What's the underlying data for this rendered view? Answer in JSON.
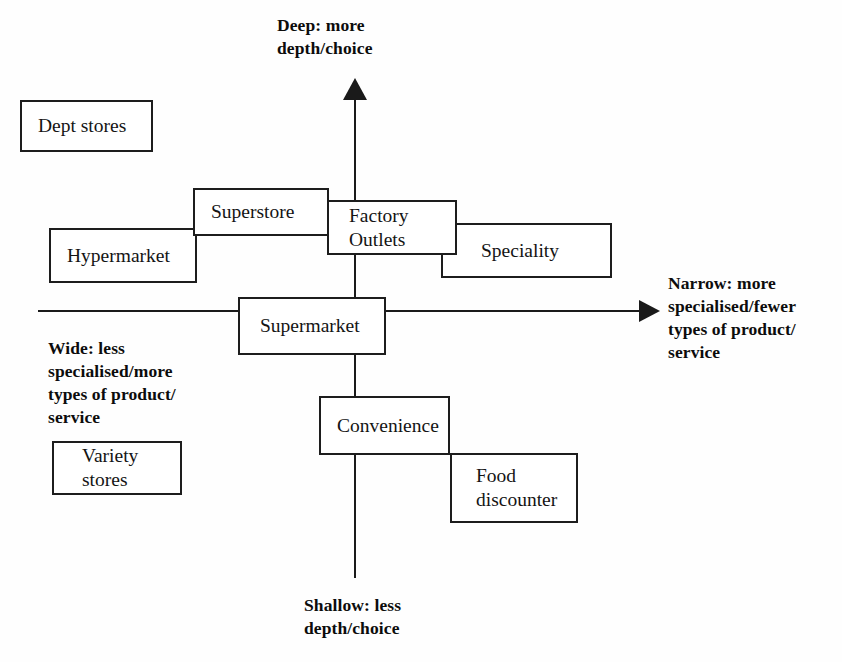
{
  "diagram": {
    "background_color": "#fefefe",
    "line_color": "#1a1a1a"
  },
  "axes": {
    "vertical": {
      "top_label": "Deep: more\ndepth/choice",
      "bottom_label": "Shallow: less\ndepth/choice",
      "top_arrow_icon": "arrow-up-icon",
      "bottom_end_icon": "line-end"
    },
    "horizontal": {
      "right_label": "Narrow: more\nspecialised/fewer\ntypes of product/\nservice",
      "left_label": "Wide: less\nspecialised/more\ntypes of product/\nservice",
      "right_arrow_icon": "arrow-right-icon"
    }
  },
  "boxes": [
    {
      "id": "dept-stores",
      "label": "Dept stores",
      "x": 20,
      "y": 100,
      "w": 133,
      "h": 52,
      "pad": "pad-l-16",
      "z": "z1"
    },
    {
      "id": "superstore",
      "label": "Superstore",
      "x": 193,
      "y": 188,
      "w": 136,
      "h": 48,
      "pad": "pad-l-16",
      "z": "z3"
    },
    {
      "id": "hypermarket",
      "label": "Hypermarket",
      "x": 49,
      "y": 228,
      "w": 148,
      "h": 55,
      "pad": "pad-l-16",
      "z": "z2"
    },
    {
      "id": "factory-outlets",
      "label": "Factory\nOutlets",
      "x": 327,
      "y": 200,
      "w": 130,
      "h": 55,
      "pad": "pad-l-20",
      "z": "z4"
    },
    {
      "id": "speciality",
      "label": "Speciality",
      "x": 441,
      "y": 223,
      "w": 171,
      "h": 55,
      "pad": "pad-l-38",
      "z": "z2"
    },
    {
      "id": "supermarket",
      "label": "Supermarket",
      "x": 238,
      "y": 297,
      "w": 148,
      "h": 58,
      "pad": "pad-l-20",
      "z": "z3"
    },
    {
      "id": "convenience",
      "label": "Convenience",
      "x": 319,
      "y": 396,
      "w": 131,
      "h": 59,
      "pad": "pad-l-16",
      "z": "z3"
    },
    {
      "id": "food-discounter",
      "label": "Food\ndiscounter",
      "x": 450,
      "y": 453,
      "w": 128,
      "h": 70,
      "pad": "pad-l-24",
      "z": "z2"
    },
    {
      "id": "variety-stores",
      "label": "Variety\nstores",
      "x": 52,
      "y": 441,
      "w": 130,
      "h": 54,
      "pad": "pad-l-28",
      "z": "z1"
    }
  ]
}
